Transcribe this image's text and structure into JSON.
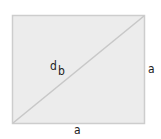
{
  "diagram": {
    "shape": "rectangle",
    "fill_color": "#ececec",
    "stroke_color": "#cdcdcd",
    "diagonal_color": "#c8c8c8",
    "labels": {
      "diagonal_d": "d",
      "diagonal_b": "b",
      "right_side": "a",
      "bottom_side": "a"
    }
  }
}
